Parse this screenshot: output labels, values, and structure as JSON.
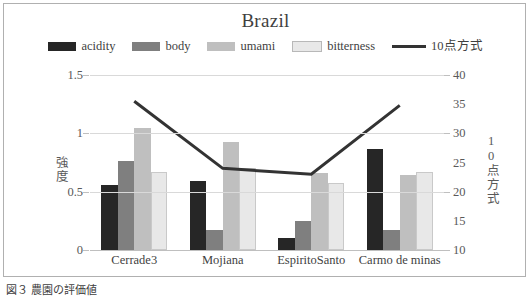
{
  "chart_data": {
    "type": "bar",
    "title": "Brazil",
    "categories": [
      "Cerrade3",
      "Mojiana",
      "EspiritoSanto",
      "Carmo de minas"
    ],
    "series": [
      {
        "name": "acidity",
        "type": "bar",
        "axis": "left",
        "color": "#262626",
        "values": [
          0.56,
          0.59,
          0.1,
          0.87
        ]
      },
      {
        "name": "body",
        "type": "bar",
        "axis": "left",
        "color": "#7f7f7f",
        "values": [
          0.76,
          0.175,
          0.245,
          0.175
        ]
      },
      {
        "name": "umami",
        "type": "bar",
        "axis": "left",
        "color": "#bfbfbf",
        "values": [
          1.05,
          0.93,
          0.66,
          0.64
        ]
      },
      {
        "name": "bitterness",
        "type": "bar",
        "axis": "left",
        "color": "#e8e8e8",
        "values": [
          0.665,
          0.7,
          0.575,
          0.665
        ]
      },
      {
        "name": "10点方式",
        "type": "line",
        "axis": "right",
        "color": "#333333",
        "values": [
          35.5,
          24.0,
          23.0,
          34.8
        ]
      }
    ],
    "xlabel": "",
    "ylabel": "強度",
    "y2label": "10点方式",
    "ylim": [
      0,
      1.5
    ],
    "y2lim": [
      10,
      40
    ],
    "yticks": [
      "0",
      "0.5",
      "1",
      "1.5"
    ],
    "ytick_values": [
      0,
      0.5,
      1,
      1.5
    ],
    "y2ticks": [
      "10",
      "15",
      "20",
      "25",
      "30",
      "35",
      "40"
    ],
    "y2tick_values": [
      10,
      15,
      20,
      25,
      30,
      35,
      40
    ],
    "grid": true,
    "legend_position": "top"
  },
  "legend": {
    "items": [
      {
        "label": "acidity",
        "color": "#262626",
        "kind": "swatch"
      },
      {
        "label": "body",
        "color": "#7f7f7f",
        "kind": "swatch"
      },
      {
        "label": "umami",
        "color": "#bfbfbf",
        "kind": "swatch"
      },
      {
        "label": "bitterness",
        "color": "#e8e8e8",
        "kind": "swatch"
      },
      {
        "label": "10点方式",
        "color": "#333333",
        "kind": "line"
      }
    ]
  },
  "caption": {
    "text": "図３ 農園の評価値"
  }
}
